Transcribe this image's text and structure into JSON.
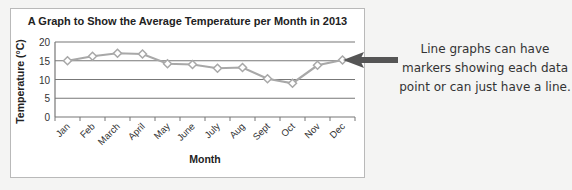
{
  "chart_data": {
    "type": "line",
    "title": "A Graph to Show the Average Temperature per Month in 2013",
    "xlabel": "Month",
    "ylabel": "Temperature (°C)",
    "categories": [
      "Jan",
      "Feb",
      "March",
      "April",
      "May",
      "June",
      "July",
      "Aug",
      "Sept",
      "Oct",
      "Nov",
      "Dec"
    ],
    "series": [
      {
        "name": "Average Temperature",
        "values": [
          15,
          16.2,
          17,
          16.8,
          14.2,
          14,
          13,
          13.2,
          10.2,
          9,
          13.8,
          15.2
        ],
        "color": "#a8a8a8",
        "marker": "diamond"
      }
    ],
    "yticks": [
      0,
      5,
      10,
      15,
      20
    ],
    "ylim": [
      0,
      20
    ],
    "grid": true,
    "legend": "none"
  },
  "annotation": {
    "text_lines": [
      "Line graphs can have",
      "markers showing each data",
      "point or can just have a line."
    ],
    "arrow_color": "#555555"
  }
}
